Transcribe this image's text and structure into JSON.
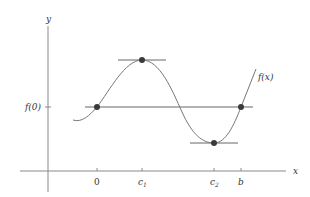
{
  "diagram": {
    "axes": {
      "x_label": "x",
      "y_label": "y"
    },
    "y_tick_label": "f(0)",
    "x_tick_labels": {
      "zero": "0",
      "c1_base": "c",
      "c1_sub": "1",
      "c2_base": "c",
      "c2_sub": "2",
      "b": "b"
    },
    "curve_label": "f(x)",
    "points": [
      {
        "name": "(0, f(0))"
      },
      {
        "name": "(c1, f(c1)) maximum"
      },
      {
        "name": "(c2, f(c2)) minimum"
      },
      {
        "name": "(b, f(b))"
      }
    ],
    "colors": {
      "axis": "#7a7a7a",
      "curve": "#777777",
      "point": "#3a3a3a",
      "text": "#333333"
    }
  }
}
